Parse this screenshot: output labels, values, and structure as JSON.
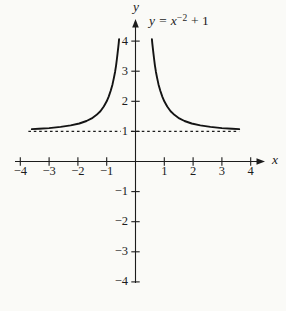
{
  "figure": {
    "background": "#fafaf7",
    "ink_color": "#1c1c1c",
    "equation": {
      "text": "y = x⁻² + 1",
      "base": "y = x",
      "exponent": "−2",
      "tail": " + 1"
    },
    "x_axis_letter": "x",
    "y_axis_letter": "y"
  },
  "chart_data": {
    "type": "line",
    "xlabel": "x",
    "ylabel": "y",
    "xlim": [
      -4,
      4
    ],
    "ylim": [
      -4,
      4
    ],
    "grid": false,
    "legend": false,
    "x_ticks": [
      {
        "value": -4,
        "label": "−4"
      },
      {
        "value": -3,
        "label": "−3"
      },
      {
        "value": -2,
        "label": "−2"
      },
      {
        "value": -1,
        "label": "−1"
      },
      {
        "value": 1,
        "label": "1"
      },
      {
        "value": 2,
        "label": "2"
      },
      {
        "value": 3,
        "label": "3"
      },
      {
        "value": 4,
        "label": "4"
      }
    ],
    "y_ticks": [
      {
        "value": 4,
        "label": "4"
      },
      {
        "value": 3,
        "label": "3"
      },
      {
        "value": 2,
        "label": "2"
      },
      {
        "value": 1,
        "label": "1"
      },
      {
        "value": -1,
        "label": "−1"
      },
      {
        "value": -2,
        "label": "−2"
      },
      {
        "value": -3,
        "label": "−3"
      },
      {
        "value": -4,
        "label": "−4"
      }
    ],
    "asymptote": {
      "y": 1,
      "style": "dashed",
      "x_range": [
        -3.72,
        3.6
      ]
    },
    "series": [
      {
        "name": "y = x^(-2) + 1 (left branch)",
        "points": [
          [
            -3.6,
            1.077
          ],
          [
            -3.35,
            1.089
          ],
          [
            -3.0,
            1.111
          ],
          [
            -2.6,
            1.148
          ],
          [
            -2.25,
            1.198
          ],
          [
            -1.95,
            1.263
          ],
          [
            -1.7,
            1.346
          ],
          [
            -1.52,
            1.433
          ],
          [
            -1.36,
            1.541
          ],
          [
            -1.22,
            1.672
          ],
          [
            -1.1,
            1.826
          ],
          [
            -1.0,
            2.0
          ],
          [
            -0.93,
            2.156
          ],
          [
            -0.86,
            2.352
          ],
          [
            -0.8,
            2.563
          ],
          [
            -0.75,
            2.778
          ],
          [
            -0.71,
            2.984
          ],
          [
            -0.675,
            3.195
          ],
          [
            -0.645,
            3.404
          ],
          [
            -0.62,
            3.601
          ],
          [
            -0.6,
            3.778
          ],
          [
            -0.585,
            3.922
          ],
          [
            -0.571,
            4.067
          ]
        ]
      },
      {
        "name": "y = x^(-2) + 1 (right branch)",
        "points": [
          [
            0.571,
            4.067
          ],
          [
            0.585,
            3.922
          ],
          [
            0.6,
            3.778
          ],
          [
            0.62,
            3.601
          ],
          [
            0.645,
            3.404
          ],
          [
            0.675,
            3.195
          ],
          [
            0.71,
            2.984
          ],
          [
            0.75,
            2.778
          ],
          [
            0.8,
            2.563
          ],
          [
            0.86,
            2.352
          ],
          [
            0.93,
            2.156
          ],
          [
            1.0,
            2.0
          ],
          [
            1.1,
            1.826
          ],
          [
            1.22,
            1.672
          ],
          [
            1.36,
            1.541
          ],
          [
            1.52,
            1.433
          ],
          [
            1.7,
            1.346
          ],
          [
            1.95,
            1.263
          ],
          [
            2.25,
            1.198
          ],
          [
            2.6,
            1.148
          ],
          [
            3.0,
            1.111
          ],
          [
            3.35,
            1.089
          ],
          [
            3.6,
            1.077
          ]
        ]
      }
    ]
  }
}
